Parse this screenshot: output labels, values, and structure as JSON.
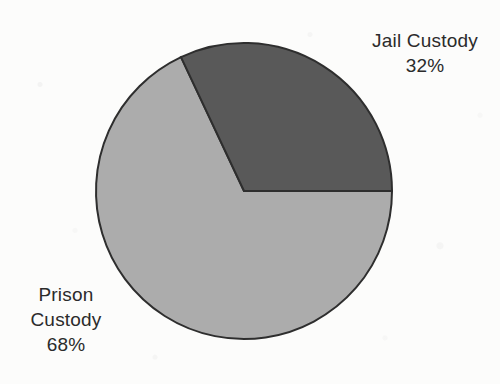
{
  "chart_data": {
    "type": "pie",
    "title": "",
    "categories": [
      "Jail Custody",
      "Prison Custody"
    ],
    "values": [
      32,
      68
    ],
    "value_labels": [
      "32%",
      "68%"
    ],
    "unit": "%",
    "legend": "none",
    "grid": false,
    "slices": [
      {
        "name": "Jail Custody",
        "value": 32,
        "value_label": "32%",
        "color": "#595959",
        "start_angle_deg": 0,
        "end_angle_deg": 115.2,
        "label_position": "top-right"
      },
      {
        "name": "Prison Custody",
        "value": 68,
        "value_label": "68%",
        "color": "#acacac",
        "start_angle_deg": 115.2,
        "end_angle_deg": 360,
        "label_position": "bottom-left"
      }
    ]
  },
  "labels": {
    "jail": {
      "name": "Jail Custody",
      "percent": "32%"
    },
    "prison": {
      "name_line1": "Prison",
      "name_line2": "Custody",
      "percent": "68%"
    }
  },
  "colors": {
    "background": "#fcfcfb",
    "slice_dark": "#595959",
    "slice_light": "#acacac",
    "outline": "#2e2e2e",
    "text": "#2b2b2b"
  }
}
